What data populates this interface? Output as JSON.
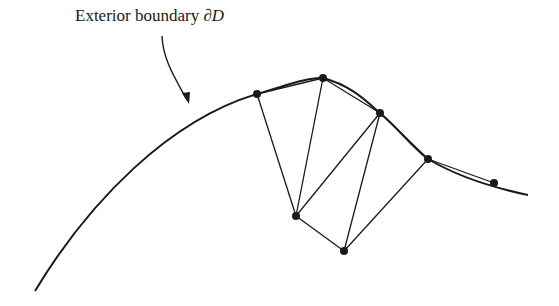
{
  "diagram": {
    "label": {
      "text": "Exterior boundary ",
      "symbol": "∂D"
    },
    "colors": {
      "stroke": "#1a1a1a",
      "background": "#ffffff"
    },
    "boundary_curve": "M 35 291 C 90 200, 170 120, 257 94 C 290 84, 310 77, 323 78 C 350 85, 365 100, 380 113 C 400 130, 410 145, 428 159 C 455 175, 490 187, 528 195",
    "arrow": {
      "path": "M 162 36 C 163 60, 175 78, 187 100",
      "tip": [
        189,
        104
      ]
    },
    "nodes": [
      {
        "id": "A",
        "x": 257,
        "y": 94
      },
      {
        "id": "B",
        "x": 323,
        "y": 78
      },
      {
        "id": "C",
        "x": 380,
        "y": 113
      },
      {
        "id": "D",
        "x": 428,
        "y": 159
      },
      {
        "id": "E",
        "x": 494,
        "y": 183
      },
      {
        "id": "F",
        "x": 296,
        "y": 216
      },
      {
        "id": "G",
        "x": 344,
        "y": 251
      }
    ],
    "edges": [
      [
        "A",
        "B"
      ],
      [
        "B",
        "C"
      ],
      [
        "C",
        "D"
      ],
      [
        "D",
        "E"
      ],
      [
        "A",
        "F"
      ],
      [
        "B",
        "F"
      ],
      [
        "F",
        "C"
      ],
      [
        "F",
        "G"
      ],
      [
        "G",
        "C"
      ],
      [
        "G",
        "D"
      ]
    ]
  }
}
